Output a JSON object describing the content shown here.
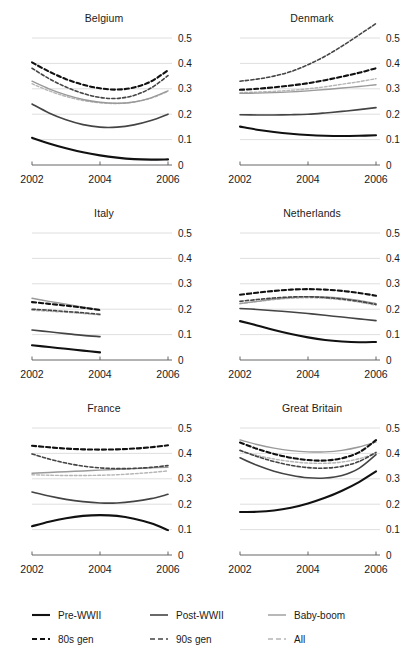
{
  "figure": {
    "title": "",
    "panel_layout": "3 rows x 2 columns"
  },
  "axis": {
    "x_ticks": [
      "2002",
      "2004",
      "2006"
    ],
    "x_tick_values": [
      2002,
      2004,
      2006
    ],
    "y_ticks": [
      "0",
      "0.1",
      "0.2",
      "0.3",
      "0.4",
      "0.5"
    ],
    "y_tick_values": [
      0,
      0.1,
      0.2,
      0.3,
      0.4,
      0.5
    ],
    "xlim": [
      2002,
      2006
    ],
    "ylim": [
      0,
      0.5
    ],
    "grid": true,
    "y_axis_side": "right"
  },
  "legend": {
    "position": "bottom",
    "rows": [
      [
        {
          "label": "Pre-WWII",
          "style": "solid",
          "color": "#111111",
          "width": 2.1
        },
        {
          "label": "Post-WWII",
          "style": "solid",
          "color": "#444444",
          "width": 1.6
        },
        {
          "label": "Baby-boom",
          "style": "solid",
          "color": "#9a9a9a",
          "width": 1.4
        }
      ],
      [
        {
          "label": "80s gen",
          "style": "dashed",
          "color": "#111111",
          "width": 2.1
        },
        {
          "label": "90s gen",
          "style": "dashed",
          "color": "#444444",
          "width": 1.6
        },
        {
          "label": "All",
          "style": "dashed",
          "color": "#b5b5b5",
          "width": 1.4
        }
      ]
    ]
  },
  "chart_data": {
    "type": "line",
    "title": "",
    "xlabel": "",
    "ylabel": "",
    "xlim": [
      2002,
      2006
    ],
    "ylim": [
      0,
      0.5
    ],
    "x": [
      2002,
      2002.5,
      2003,
      2003.5,
      2004,
      2004.5,
      2005,
      2005.5,
      2006
    ],
    "grid": true,
    "legend_position": "bottom",
    "series_styles": {
      "Pre-WWII": {
        "style": "solid",
        "color": "#111111",
        "width": 2.1
      },
      "Post-WWII": {
        "style": "solid",
        "color": "#444444",
        "width": 1.6
      },
      "Baby-boom": {
        "style": "solid",
        "color": "#9a9a9a",
        "width": 1.4
      },
      "80s gen": {
        "style": "dashed",
        "color": "#111111",
        "width": 2.1
      },
      "90s gen": {
        "style": "dashed",
        "color": "#444444",
        "width": 1.6
      },
      "All": {
        "style": "dashed",
        "color": "#b5b5b5",
        "width": 1.4
      }
    },
    "panels": [
      {
        "title": "Belgium",
        "x": [
          2002,
          2002.5,
          2003,
          2003.5,
          2004,
          2004.5,
          2005,
          2005.5,
          2006
        ],
        "series": [
          {
            "name": "Pre-WWII",
            "values": [
              0.107,
              0.085,
              0.066,
              0.05,
              0.038,
              0.029,
              0.023,
              0.021,
              0.022
            ]
          },
          {
            "name": "Post-WWII",
            "values": [
              0.24,
              0.205,
              0.178,
              0.159,
              0.149,
              0.149,
              0.158,
              0.175,
              0.2
            ]
          },
          {
            "name": "Baby-boom",
            "values": [
              0.33,
              0.3,
              0.276,
              0.258,
              0.247,
              0.243,
              0.248,
              0.264,
              0.292
            ]
          },
          {
            "name": "80s gen",
            "values": [
              0.404,
              0.368,
              0.338,
              0.316,
              0.302,
              0.297,
              0.305,
              0.329,
              0.373
            ]
          },
          {
            "name": "90s gen",
            "values": [
              0.381,
              0.34,
              0.307,
              0.282,
              0.266,
              0.262,
              0.274,
              0.303,
              0.352
            ]
          },
          {
            "name": "All",
            "values": [
              0.32,
              0.292,
              0.27,
              0.254,
              0.245,
              0.242,
              0.248,
              0.263,
              0.29
            ]
          }
        ]
      },
      {
        "title": "Denmark",
        "x": [
          2002,
          2002.5,
          2003,
          2003.5,
          2004,
          2004.5,
          2005,
          2005.5,
          2006
        ],
        "series": [
          {
            "name": "Pre-WWII",
            "values": [
              0.151,
              0.139,
              0.13,
              0.123,
              0.118,
              0.115,
              0.114,
              0.115,
              0.117
            ]
          },
          {
            "name": "Post-WWII",
            "values": [
              0.198,
              0.197,
              0.197,
              0.198,
              0.2,
              0.205,
              0.211,
              0.218,
              0.226
            ]
          },
          {
            "name": "Baby-boom",
            "values": [
              0.282,
              0.283,
              0.285,
              0.288,
              0.292,
              0.297,
              0.303,
              0.309,
              0.316
            ]
          },
          {
            "name": "80s gen",
            "values": [
              0.296,
              0.3,
              0.306,
              0.313,
              0.322,
              0.334,
              0.348,
              0.363,
              0.381
            ]
          },
          {
            "name": "90s gen",
            "values": [
              0.33,
              0.338,
              0.35,
              0.368,
              0.395,
              0.428,
              0.468,
              0.512,
              0.557
            ]
          },
          {
            "name": "All",
            "values": [
              0.285,
              0.287,
              0.29,
              0.294,
              0.3,
              0.308,
              0.318,
              0.328,
              0.34
            ]
          }
        ]
      },
      {
        "title": "Italy",
        "x": [
          2002,
          2002.5,
          2003,
          2003.5,
          2004
        ],
        "series": [
          {
            "name": "Pre-WWII",
            "values": [
              0.058,
              0.051,
              0.044,
              0.037,
              0.03
            ]
          },
          {
            "name": "Post-WWII",
            "values": [
              0.118,
              0.111,
              0.104,
              0.097,
              0.092
            ]
          },
          {
            "name": "Baby-boom",
            "values": [
              0.243,
              0.231,
              0.22,
              0.208,
              0.196
            ]
          },
          {
            "name": "80s gen",
            "values": [
              0.228,
              0.221,
              0.214,
              0.206,
              0.197
            ]
          },
          {
            "name": "90s gen",
            "values": [
              0.2,
              0.196,
              0.191,
              0.186,
              0.18
            ]
          },
          {
            "name": "All",
            "values": [
              0.196,
              0.192,
              0.188,
              0.183,
              0.177
            ]
          }
        ]
      },
      {
        "title": "Netherlands",
        "x": [
          2002,
          2002.5,
          2003,
          2003.5,
          2004,
          2004.5,
          2005,
          2005.5,
          2006
        ],
        "series": [
          {
            "name": "Pre-WWII",
            "values": [
              0.153,
              0.136,
              0.118,
              0.102,
              0.089,
              0.079,
              0.073,
              0.07,
              0.071
            ]
          },
          {
            "name": "Post-WWII",
            "values": [
              0.203,
              0.199,
              0.194,
              0.189,
              0.183,
              0.176,
              0.169,
              0.162,
              0.155
            ]
          },
          {
            "name": "Baby-boom",
            "values": [
              0.222,
              0.231,
              0.24,
              0.246,
              0.249,
              0.248,
              0.243,
              0.234,
              0.222
            ]
          },
          {
            "name": "80s gen",
            "values": [
              0.257,
              0.265,
              0.272,
              0.277,
              0.279,
              0.277,
              0.272,
              0.264,
              0.253
            ]
          },
          {
            "name": "90s gen",
            "values": [
              0.231,
              0.238,
              0.244,
              0.248,
              0.249,
              0.246,
              0.24,
              0.231,
              0.219
            ]
          },
          {
            "name": "All",
            "values": [
              0.222,
              0.23,
              0.238,
              0.243,
              0.245,
              0.243,
              0.237,
              0.228,
              0.216
            ]
          }
        ]
      },
      {
        "title": "France",
        "x": [
          2002,
          2002.5,
          2003,
          2003.5,
          2004,
          2004.5,
          2005,
          2005.5,
          2006
        ],
        "series": [
          {
            "name": "Pre-WWII",
            "values": [
              0.113,
              0.131,
              0.145,
              0.154,
              0.157,
              0.154,
              0.143,
              0.125,
              0.098
            ]
          },
          {
            "name": "Post-WWII",
            "values": [
              0.248,
              0.232,
              0.219,
              0.21,
              0.205,
              0.205,
              0.211,
              0.222,
              0.239
            ]
          },
          {
            "name": "Baby-boom",
            "values": [
              0.322,
              0.325,
              0.328,
              0.331,
              0.334,
              0.337,
              0.34,
              0.343,
              0.345
            ]
          },
          {
            "name": "80s gen",
            "values": [
              0.43,
              0.424,
              0.419,
              0.416,
              0.415,
              0.416,
              0.419,
              0.424,
              0.432
            ]
          },
          {
            "name": "90s gen",
            "values": [
              0.398,
              0.378,
              0.362,
              0.35,
              0.343,
              0.34,
              0.341,
              0.345,
              0.352
            ]
          },
          {
            "name": "All",
            "values": [
              0.316,
              0.314,
              0.313,
              0.313,
              0.314,
              0.316,
              0.32,
              0.325,
              0.331
            ]
          }
        ]
      },
      {
        "title": "Great Britain",
        "x": [
          2002,
          2002.5,
          2003,
          2003.5,
          2004,
          2004.5,
          2005,
          2005.5,
          2006
        ],
        "series": [
          {
            "name": "Pre-WWII",
            "values": [
              0.169,
              0.17,
              0.175,
              0.186,
              0.203,
              0.225,
              0.253,
              0.287,
              0.329
            ]
          },
          {
            "name": "Post-WWII",
            "values": [
              0.383,
              0.353,
              0.33,
              0.314,
              0.304,
              0.303,
              0.313,
              0.341,
              0.395
            ]
          },
          {
            "name": "Baby-boom",
            "values": [
              0.453,
              0.435,
              0.421,
              0.411,
              0.406,
              0.406,
              0.412,
              0.425,
              0.445
            ]
          },
          {
            "name": "80s gen",
            "values": [
              0.443,
              0.418,
              0.398,
              0.383,
              0.374,
              0.372,
              0.381,
              0.404,
              0.452
            ]
          },
          {
            "name": "90s gen",
            "values": [
              0.412,
              0.388,
              0.368,
              0.353,
              0.344,
              0.342,
              0.349,
              0.368,
              0.404
            ]
          },
          {
            "name": "All",
            "values": [
              0.41,
              0.392,
              0.378,
              0.368,
              0.362,
              0.361,
              0.366,
              0.379,
              0.4
            ]
          }
        ]
      }
    ]
  }
}
